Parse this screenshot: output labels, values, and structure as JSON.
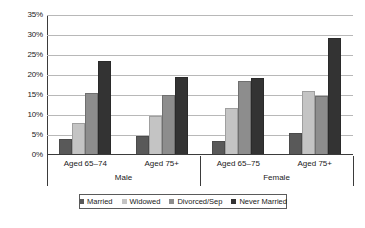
{
  "chart_data": {
    "type": "bar",
    "title": "",
    "xlabel": "",
    "ylabel": "",
    "ylim": [
      0,
      35
    ],
    "grid": true,
    "legend_position": "bottom",
    "y_ticks": [
      "0%",
      "5%",
      "10%",
      "15%",
      "20%",
      "25%",
      "30%",
      "35%"
    ],
    "y_tick_values": [
      0,
      5,
      10,
      15,
      20,
      25,
      30,
      35
    ],
    "categories": [
      "Aged 65–74",
      "Aged 75+",
      "Aged 65–75",
      "Aged 75+"
    ],
    "group_labels": [
      "Male",
      "Female"
    ],
    "series": [
      {
        "name": "Married",
        "color": "#595959",
        "values": [
          4.0,
          4.8,
          3.6,
          5.5
        ]
      },
      {
        "name": "Widowed",
        "color": "#c4c4c4",
        "values": [
          8.0,
          9.7,
          11.8,
          16.0
        ]
      },
      {
        "name": "Divorced/Sep",
        "color": "#8d8d8d",
        "values": [
          15.5,
          15.0,
          18.5,
          14.8
        ]
      },
      {
        "name": "Never Married",
        "color": "#333333",
        "values": [
          23.5,
          19.5,
          19.3,
          29.2
        ]
      }
    ]
  },
  "legend": {
    "items": [
      {
        "label": "Married"
      },
      {
        "label": "Widowed"
      },
      {
        "label": "Divorced/Sep"
      },
      {
        "label": "Never Married"
      }
    ]
  }
}
